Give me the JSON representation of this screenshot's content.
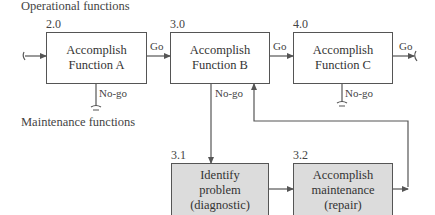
{
  "sections": {
    "operational": "Operational functions",
    "maintenance": "Maintenance functions"
  },
  "operational_boxes": [
    {
      "id": "2.0",
      "line1": "Accomplish",
      "line2": "Function A"
    },
    {
      "id": "3.0",
      "line1": "Accomplish",
      "line2": "Function B"
    },
    {
      "id": "4.0",
      "line1": "Accomplish",
      "line2": "Function C"
    }
  ],
  "maintenance_boxes": [
    {
      "id": "3.1",
      "line1": "Identify",
      "line2": "problem",
      "line3": "(diagnostic)"
    },
    {
      "id": "3.2",
      "line1": "Accomplish",
      "line2": "maintenance",
      "line3": "(repair)"
    }
  ],
  "flow_labels": {
    "go_ab": "Go",
    "go_bc": "Go",
    "go_out": "Go",
    "nogo_a": "No-go",
    "nogo_b": "No-go",
    "nogo_c": "No-go"
  },
  "colors": {
    "operational_fill": "#ffffff",
    "maintenance_fill": "#dcdcdc",
    "line": "#555555"
  }
}
